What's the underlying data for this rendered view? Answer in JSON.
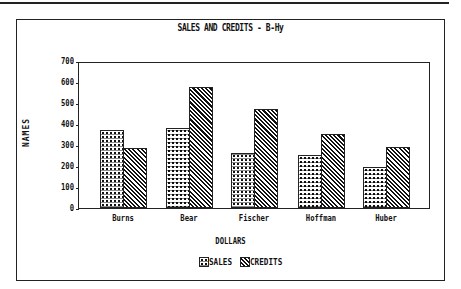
{
  "chart_data": {
    "type": "bar",
    "title": "SALES AND CREDITS - B-Hy",
    "xlabel": "DOLLARS",
    "ylabel": "NAMES",
    "categories": [
      "Burns",
      "Bear",
      "Fischer",
      "Hoffman",
      "Huber"
    ],
    "series": [
      {
        "name": "SALES",
        "values": [
          375,
          385,
          267,
          257,
          200
        ],
        "pattern": "crosshatch-dots"
      },
      {
        "name": "CREDITS",
        "values": [
          290,
          585,
          476,
          357,
          295
        ],
        "pattern": "diagonal-hatch"
      }
    ],
    "ylim": [
      0,
      700
    ],
    "yticks": [
      "700",
      "600",
      "500",
      "400",
      "300",
      "200",
      "100",
      "0"
    ],
    "grid": false,
    "legend_position": "bottom"
  },
  "colors": {
    "ink": "#111111",
    "background": "#ffffff"
  }
}
